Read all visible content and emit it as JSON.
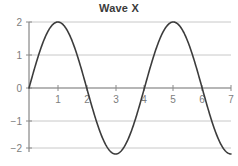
{
  "chart_data": {
    "type": "line",
    "title": "Wave X",
    "xlabel": "",
    "ylabel": "",
    "xlim": [
      0,
      7
    ],
    "ylim": [
      -2,
      2
    ],
    "grid": true,
    "legend": false,
    "x_ticks": [
      1,
      2,
      3,
      4,
      5,
      6,
      7
    ],
    "x_tick_labels": [
      "1",
      "2",
      "3",
      "4",
      "5",
      "6",
      "7"
    ],
    "y_ticks": [
      2,
      1,
      0,
      -1,
      -2
    ],
    "y_tick_labels": [
      "2",
      "1",
      "0",
      "−1",
      "−2"
    ],
    "series": [
      {
        "name": "Wave X",
        "formula": "y = 2*sin(pi*x/2)",
        "color": "#3c3c3c",
        "x": [
          0,
          0.25,
          0.5,
          0.75,
          1,
          1.25,
          1.5,
          1.75,
          2,
          2.25,
          2.5,
          2.75,
          3,
          3.25,
          3.5,
          3.75,
          4,
          4.25,
          4.5,
          4.75,
          5,
          5.25,
          5.5,
          5.75,
          6,
          6.25,
          6.5,
          6.75,
          7
        ],
        "y": [
          0,
          0.765,
          1.414,
          1.848,
          2,
          1.848,
          1.414,
          0.765,
          0,
          -0.765,
          -1.414,
          -1.848,
          -2,
          -1.848,
          -1.414,
          -0.765,
          0,
          0.765,
          1.414,
          1.848,
          2,
          1.848,
          1.414,
          0.765,
          0,
          -0.765,
          -1.414,
          -1.848,
          -2
        ],
        "maxima": [
          {
            "x": 1,
            "y": 2
          },
          {
            "x": 5,
            "y": 2
          }
        ],
        "minima": [
          {
            "x": 3,
            "y": -2
          },
          {
            "x": 7,
            "y": -2
          }
        ],
        "zero_crossings": [
          0,
          2,
          4,
          6
        ],
        "amplitude": 2,
        "period": 4
      }
    ]
  },
  "style": {
    "grid_color": "#c8c8c8",
    "axis_color": "#6e6e6e",
    "curve_color": "#3c3c3c",
    "tick_text_color": "#7d7d7d",
    "title_color": "#3b3b3b",
    "background": "#ffffff"
  }
}
